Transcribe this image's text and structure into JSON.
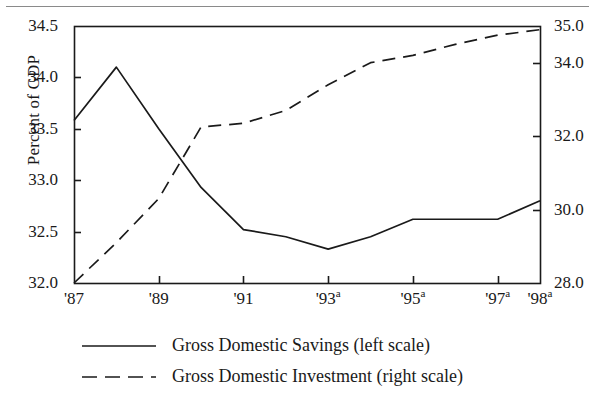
{
  "chart_data": {
    "type": "line",
    "title": "",
    "xlabel": "",
    "ylabel": "Percent of GDP",
    "ylabel_right": "",
    "grid": false,
    "legend_position": "bottom",
    "x": [
      "'87",
      "'88",
      "'89",
      "'90",
      "'91",
      "'92",
      "'93",
      "'94",
      "'95",
      "'96",
      "'97",
      "'98"
    ],
    "xtick_labels": [
      {
        "label": "'87",
        "superscript": "",
        "x_value": "'87"
      },
      {
        "label": "'89",
        "superscript": "",
        "x_value": "'89"
      },
      {
        "label": "'91",
        "superscript": "",
        "x_value": "'91"
      },
      {
        "label": "'93",
        "superscript": "a",
        "x_value": "'93"
      },
      {
        "label": "'95",
        "superscript": "a",
        "x_value": "'95"
      },
      {
        "label": "'97",
        "superscript": "a",
        "x_value": "'97"
      },
      {
        "label": "'98",
        "superscript": "a",
        "x_value": "'98"
      }
    ],
    "ylim": [
      32.0,
      34.5
    ],
    "ylim_right": [
      28.0,
      35.0
    ],
    "ytick_labels_left": [
      "32.0",
      "32.5",
      "33.0",
      "33.5",
      "34.0",
      "34.5"
    ],
    "ytick_values_left": [
      32.0,
      32.5,
      33.0,
      33.5,
      34.0,
      34.5
    ],
    "ytick_labels_right": [
      "28.0",
      "30.0",
      "32.0",
      "34.0",
      "35.0"
    ],
    "ytick_values_right": [
      28.0,
      30.0,
      32.0,
      34.0,
      35.0
    ],
    "series": [
      {
        "name": "Gross Domestic Savings (left scale)",
        "axis": "left",
        "style": "solid",
        "color": "#1a1a1a",
        "values": [
          33.58,
          34.1,
          33.5,
          32.93,
          32.52,
          32.45,
          32.33,
          32.45,
          32.62,
          32.62,
          32.62,
          32.8
        ]
      },
      {
        "name": "Gross Domestic Investment (right scale)",
        "axis": "right",
        "style": "dashed",
        "color": "#1a1a1a",
        "values": [
          28.0,
          29.1,
          30.3,
          32.25,
          32.35,
          32.7,
          33.4,
          34.0,
          34.2,
          34.5,
          34.75,
          34.9
        ]
      }
    ]
  },
  "legend": {
    "items": [
      {
        "label": "Gross Domestic Savings (left scale)",
        "style": "solid"
      },
      {
        "label": "Gross Domestic Investment (right scale)",
        "style": "dashed"
      }
    ]
  },
  "axis_titles": {
    "left": "Percent of GDP"
  },
  "colors": {
    "line": "#1a1a1a",
    "frame": "#1a1a1a",
    "rule": "#8a8a8a",
    "background": "#ffffff"
  }
}
